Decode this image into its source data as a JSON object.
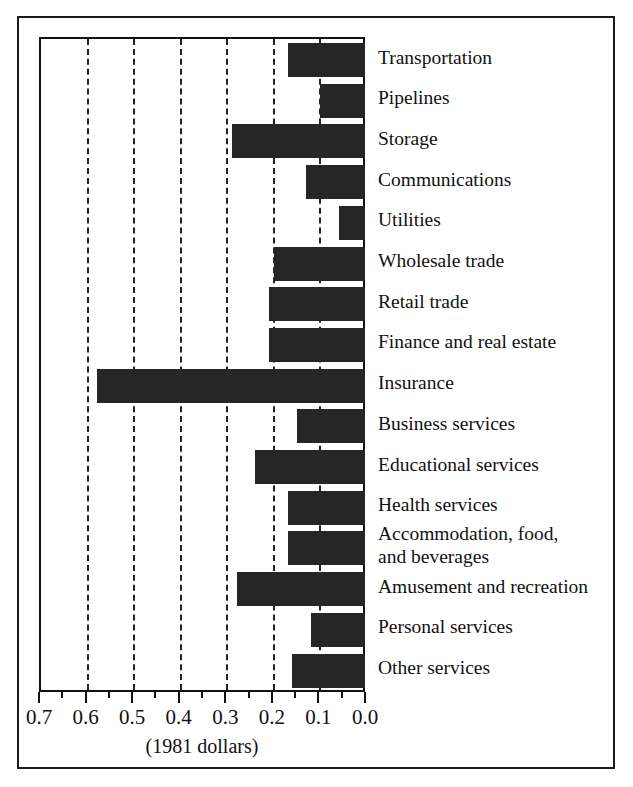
{
  "chart": {
    "type": "bar",
    "orientation": "horizontal",
    "axis_title": "(1981 dollars)",
    "xlabel": "(1981 dollars)",
    "ylabel": "",
    "title": "",
    "grid": true,
    "grid_style": "dashed vertical gridlines at 0.6, 0.5, 0.4, 0.3, 0.2, 0.1",
    "axis_reversed": true,
    "xlim": [
      0.7,
      0.0
    ],
    "bar_color": "#262626",
    "frame_color": "#111111",
    "tick_labels": [
      "0.7",
      "0.6",
      "0.5",
      "0.4",
      "0.3",
      "0.2",
      "0.1",
      "0.0"
    ],
    "tick_values": [
      0.7,
      0.6,
      0.5,
      0.4,
      0.3,
      0.2,
      0.1,
      0.0
    ]
  },
  "chart_data": {
    "type": "bar",
    "title": "",
    "xlabel": "(1981 dollars)",
    "ylabel": "",
    "xlim": [
      0.7,
      0.0
    ],
    "grid": true,
    "legend": null,
    "orientation": "horizontal",
    "categories": [
      "Transportation",
      "Pipelines",
      "Storage",
      "Communications",
      "Utilities",
      "Wholesale trade",
      "Retail trade",
      "Finance and real estate",
      "Insurance",
      "Business services",
      "Educational services",
      "Health services",
      "Accommodation, food,\nand beverages",
      "Amusement and recreation",
      "Personal services",
      "Other services"
    ],
    "values": [
      0.17,
      0.1,
      0.29,
      0.13,
      0.06,
      0.2,
      0.21,
      0.21,
      0.58,
      0.15,
      0.24,
      0.17,
      0.17,
      0.28,
      0.12,
      0.16
    ]
  },
  "labels": [
    {
      "text": "Transportation"
    },
    {
      "text": "Pipelines"
    },
    {
      "text": "Storage"
    },
    {
      "text": "Communications"
    },
    {
      "text": "Utilities"
    },
    {
      "text": "Wholesale trade"
    },
    {
      "text": "Retail trade"
    },
    {
      "text": "Finance and real estate"
    },
    {
      "text": "Insurance"
    },
    {
      "text": "Business services"
    },
    {
      "text": "Educational services"
    },
    {
      "text": "Health services"
    },
    {
      "text": "Accommodation, food,\nand beverages"
    },
    {
      "text": "Amusement and recreation"
    },
    {
      "text": "Personal services"
    },
    {
      "text": "Other services"
    }
  ]
}
